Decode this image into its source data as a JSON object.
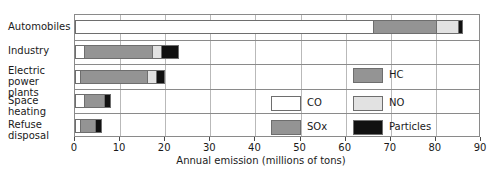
{
  "chart_data": {
    "type": "bar",
    "orientation": "horizontal",
    "stacked": true,
    "title": "",
    "xlabel": "Annual emission (millions of tons)",
    "ylabel": "",
    "xlim": [
      0,
      90
    ],
    "xticks": [
      0,
      10,
      20,
      30,
      40,
      50,
      60,
      70,
      80,
      90
    ],
    "xtick_labels": [
      "0",
      "10",
      "20",
      "30",
      "40",
      "50",
      "60",
      "70",
      "80",
      "90"
    ],
    "grid": true,
    "legend_position": "inside-lower-right",
    "categories": [
      "Automobiles",
      "Industry",
      "Electric power\nplants",
      "Space heating",
      "Refuse disposal"
    ],
    "series": [
      {
        "name": "CO",
        "color": "#ffffff",
        "values": [
          66.0,
          2.0,
          1.0,
          2.0,
          1.0
        ]
      },
      {
        "name": "HC",
        "color": "#949494",
        "values": [
          14.0,
          0.0,
          0.0,
          0.0,
          0.0
        ]
      },
      {
        "name": "SOx",
        "color": "#949494",
        "values": [
          0.0,
          15.0,
          15.0,
          4.5,
          3.5
        ]
      },
      {
        "name": "NO",
        "color": "#e2e2e2",
        "values": [
          5.0,
          2.0,
          2.0,
          0.0,
          0.0
        ]
      },
      {
        "name": "Particles",
        "color": "#111111",
        "values": [
          1.0,
          4.0,
          2.0,
          1.5,
          1.5
        ]
      }
    ],
    "totals": [
      86.0,
      23.0,
      20.0,
      8.0,
      6.0
    ],
    "bars": [
      {
        "category": "Automobiles",
        "segments": [
          {
            "series": "CO",
            "start": 0.0,
            "end": 66.0,
            "color": "#ffffff"
          },
          {
            "series": "HC",
            "start": 66.0,
            "end": 80.0,
            "color": "#949494"
          },
          {
            "series": "NO",
            "start": 80.0,
            "end": 85.0,
            "color": "#e2e2e2"
          },
          {
            "series": "Particles",
            "start": 85.0,
            "end": 86.0,
            "color": "#111111"
          }
        ]
      },
      {
        "category": "Industry",
        "segments": [
          {
            "series": "CO",
            "start": 0.0,
            "end": 2.0,
            "color": "#ffffff"
          },
          {
            "series": "SOx",
            "start": 2.0,
            "end": 17.0,
            "color": "#949494"
          },
          {
            "series": "NO",
            "start": 17.0,
            "end": 19.0,
            "color": "#e2e2e2"
          },
          {
            "series": "Particles",
            "start": 19.0,
            "end": 23.0,
            "color": "#111111"
          }
        ]
      },
      {
        "category": "Electric power plants",
        "segments": [
          {
            "series": "CO",
            "start": 0.0,
            "end": 1.0,
            "color": "#ffffff"
          },
          {
            "series": "SOx",
            "start": 1.0,
            "end": 16.0,
            "color": "#949494"
          },
          {
            "series": "NO",
            "start": 16.0,
            "end": 18.0,
            "color": "#e2e2e2"
          },
          {
            "series": "Particles",
            "start": 18.0,
            "end": 20.0,
            "color": "#111111"
          }
        ]
      },
      {
        "category": "Space heating",
        "segments": [
          {
            "series": "CO",
            "start": 0.0,
            "end": 2.0,
            "color": "#ffffff"
          },
          {
            "series": "SOx",
            "start": 2.0,
            "end": 6.5,
            "color": "#949494"
          },
          {
            "series": "Particles",
            "start": 6.5,
            "end": 8.0,
            "color": "#111111"
          }
        ]
      },
      {
        "category": "Refuse disposal",
        "segments": [
          {
            "series": "CO",
            "start": 0.0,
            "end": 1.0,
            "color": "#ffffff"
          },
          {
            "series": "SOx",
            "start": 1.0,
            "end": 4.5,
            "color": "#949494"
          },
          {
            "series": "Particles",
            "start": 4.5,
            "end": 6.0,
            "color": "#111111"
          }
        ]
      }
    ],
    "legend": [
      {
        "label": "CO",
        "color": "#ffffff"
      },
      {
        "label": "SOx",
        "color": "#949494"
      },
      {
        "label": "HC",
        "color": "#949494"
      },
      {
        "label": "NO",
        "color": "#e2e2e2"
      },
      {
        "label": "Particles",
        "color": "#111111"
      }
    ]
  },
  "axis": {
    "title": "Annual emission (millions of tons)"
  },
  "colors": {
    "co": "#ffffff",
    "sox": "#949494",
    "hc": "#949494",
    "no": "#e2e2e2",
    "particles": "#111111",
    "frame": "#8a8a8a",
    "grid": "#b9b9b9",
    "text": "#1a1a1a"
  }
}
